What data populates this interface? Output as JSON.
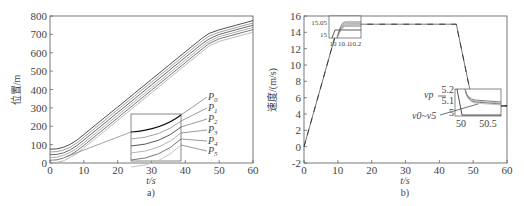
{
  "chart_data": [
    {
      "id": "a",
      "type": "line",
      "caption": "a)",
      "xlabel": "t/s",
      "ylabel": "位置/m",
      "xlim": [
        0,
        60
      ],
      "ylim": [
        0,
        800
      ],
      "xticks": [
        0,
        10,
        20,
        30,
        40,
        50,
        60
      ],
      "yticks": [
        0,
        100,
        200,
        300,
        400,
        500,
        600,
        700,
        800
      ],
      "grid": false,
      "legend": [
        "P0",
        "P1",
        "P2",
        "P3",
        "P4",
        "P5"
      ],
      "x": [
        0,
        2,
        4,
        6,
        8,
        10,
        15,
        20,
        25,
        30,
        35,
        40,
        45,
        47,
        50,
        55,
        60
      ],
      "series": [
        {
          "name": "P0",
          "values": [
            75,
            77,
            86,
            102,
            125,
            155,
            230,
            305,
            380,
            455,
            530,
            605,
            680,
            705,
            725,
            750,
            775
          ]
        },
        {
          "name": "P1",
          "values": [
            60,
            62,
            70,
            86,
            110,
            140,
            215,
            290,
            365,
            440,
            515,
            590,
            665,
            690,
            712,
            737,
            762
          ]
        },
        {
          "name": "P2",
          "values": [
            45,
            47,
            55,
            72,
            95,
            125,
            200,
            275,
            350,
            425,
            500,
            575,
            650,
            675,
            700,
            725,
            750
          ]
        },
        {
          "name": "P3",
          "values": [
            30,
            32,
            42,
            58,
            81,
            110,
            185,
            260,
            335,
            410,
            485,
            560,
            635,
            662,
            688,
            713,
            738
          ]
        },
        {
          "name": "P4",
          "values": [
            15,
            17,
            27,
            44,
            67,
            96,
            171,
            246,
            321,
            396,
            471,
            546,
            621,
            650,
            676,
            701,
            726
          ]
        },
        {
          "name": "P5",
          "values": [
            0,
            3,
            12,
            30,
            53,
            82,
            157,
            232,
            307,
            382,
            457,
            532,
            607,
            636,
            662,
            687,
            712
          ]
        }
      ],
      "inset": {
        "description": "zoomed view of P0–P5 curves"
      }
    },
    {
      "id": "b",
      "type": "line",
      "caption": "b)",
      "xlabel": "t/s",
      "ylabel": "速度/(m/s)",
      "xlim": [
        0,
        60
      ],
      "ylim": [
        -2,
        16
      ],
      "xticks": [
        0,
        10,
        20,
        30,
        40,
        50,
        60
      ],
      "yticks": [
        -2,
        0,
        2,
        4,
        6,
        8,
        10,
        12,
        14,
        16
      ],
      "grid": false,
      "x": [
        0,
        10.2,
        45,
        50,
        60
      ],
      "series": [
        {
          "name": "vp",
          "values": [
            0,
            15,
            15,
            5,
            5
          ]
        },
        {
          "name": "v0~v5",
          "values": [
            0,
            15.03,
            15,
            5.1,
            5.1
          ]
        }
      ],
      "annotations": [
        "vp",
        "v0~v5"
      ],
      "inset_top": {
        "xticks": [
          "10",
          "10.1",
          "10.2"
        ],
        "yticks": [
          "15",
          "15.05"
        ]
      },
      "inset_right": {
        "xticks": [
          "50",
          "50.5"
        ],
        "yticks": [
          "5",
          "5.1",
          "5.2"
        ]
      }
    }
  ],
  "labels": {
    "a_caption": "a)",
    "b_caption": "b)",
    "a_xlabel": "t/s",
    "b_xlabel": "t/s",
    "a_ylabel": "位置/m",
    "b_ylabel": "速度/(m/s)",
    "legend": [
      "P0",
      "P1",
      "P2",
      "P3",
      "P4",
      "P5"
    ],
    "vp": "vp",
    "v05": "v0~v5",
    "inset_top_x": [
      "10",
      "10.1",
      "10.2"
    ],
    "inset_top_y": [
      "15",
      "15.05"
    ],
    "inset_right_x": [
      "50",
      "50.5"
    ],
    "inset_right_y": [
      "5",
      "5.1",
      "5.2"
    ]
  }
}
